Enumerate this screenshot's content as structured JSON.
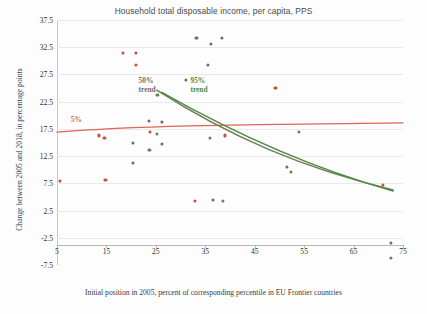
{
  "chart_data": {
    "type": "scatter",
    "title": "Household total disposable income, per capita, PPS",
    "xlabel": "Initial position in 2005, percent of corresponding percentile in EU Frontier countries",
    "ylabel": "Change between 2005 and 2018, in percentage points",
    "xlim": [
      5,
      75
    ],
    "ylim": [
      -7.5,
      37.5
    ],
    "xticks": [
      5,
      15,
      25,
      35,
      45,
      55,
      65,
      75
    ],
    "yticks": [
      37.5,
      32.5,
      27.5,
      22.5,
      17.5,
      12.5,
      7.5,
      2.5,
      -2.5,
      -7.5
    ],
    "grid": true,
    "legend_position": "in-plot-annotations",
    "colors": {
      "p5": "#dd6656",
      "p50": "#6f6f6f",
      "p95": "#5a8a4e",
      "grid": "#e9e9e9",
      "axis": "#b8b8b8",
      "title_text": "#4a4a4a"
    },
    "annotations": [
      {
        "name": "trend-label-50",
        "text": "50%\ntrend",
        "x": 21.5,
        "y": 26.2,
        "color": "#6f6f6f"
      },
      {
        "name": "trend-label-95",
        "text": "95%\ntrend",
        "x": 32.0,
        "y": 26.2,
        "color": "#4f8a3f"
      },
      {
        "name": "trend-label-5",
        "text": "5%",
        "x": 7.8,
        "y": 18.9,
        "color": "#dd6656"
      }
    ],
    "series": [
      {
        "name": "5th percentile",
        "color": "#cf4a3a",
        "points": [
          [
            5.6,
            8.0
          ],
          [
            13.5,
            16.3
          ],
          [
            14.6,
            15.9
          ],
          [
            14.8,
            8.2
          ],
          [
            18.3,
            31.4
          ],
          [
            21.0,
            31.4
          ],
          [
            21.0,
            29.3
          ],
          [
            23.8,
            16.9
          ],
          [
            32.9,
            4.3
          ],
          [
            39.0,
            16.3
          ],
          [
            49.2,
            25.1
          ],
          [
            71.0,
            7.2
          ]
        ]
      },
      {
        "name": "50th percentile",
        "color": "#6b6b6b",
        "points": [
          [
            20.3,
            15.0
          ],
          [
            23.6,
            18.9
          ],
          [
            26.2,
            18.8
          ],
          [
            26.2,
            14.8
          ],
          [
            31.1,
            26.5
          ],
          [
            33.2,
            34.2
          ],
          [
            35.5,
            29.3
          ],
          [
            36.2,
            33.1
          ],
          [
            36.5,
            4.5
          ],
          [
            38.3,
            34.2
          ],
          [
            51.5,
            10.5
          ],
          [
            20.3,
            11.2
          ],
          [
            72.5,
            -3.5
          ]
        ]
      },
      {
        "name": "95th percentile",
        "color": "#5a8a4e",
        "points": [
          [
            23.7,
            13.6
          ],
          [
            25.2,
            16.6
          ],
          [
            25.3,
            23.8
          ],
          [
            35.9,
            15.8
          ],
          [
            38.5,
            4.2
          ],
          [
            52.3,
            9.6
          ],
          [
            54.0,
            16.9
          ],
          [
            72.5,
            -6.2
          ]
        ]
      }
    ],
    "trendlines": [
      {
        "name": "trend-5",
        "color": "#dd6656",
        "type": "near-flat",
        "y_at_x5": 16.9,
        "y_at_x75": 18.6
      },
      {
        "name": "trend-50",
        "color": "#6f6f6f",
        "type": "decreasing-convex",
        "y_at_x25": 24.6,
        "y_at_x73": 6.3
      },
      {
        "name": "trend-95",
        "color": "#4f8a3f",
        "type": "decreasing-convex",
        "y_at_x26": 24.2,
        "y_at_x73": 6.1
      }
    ]
  }
}
